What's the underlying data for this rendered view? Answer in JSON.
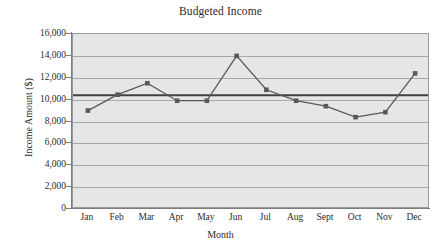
{
  "chart_data": {
    "type": "line",
    "title": "Budgeted Income",
    "xlabel": "Month",
    "ylabel": "Income Amount ($)",
    "categories": [
      "Jan",
      "Feb",
      "Mar",
      "Apr",
      "May",
      "Jun",
      "Jul",
      "Aug",
      "Sept",
      "Oct",
      "Nov",
      "Dec"
    ],
    "values": [
      9000,
      10450,
      11500,
      9900,
      9900,
      14000,
      10900,
      9900,
      9400,
      8400,
      8850,
      12400
    ],
    "series": [
      {
        "name": "Budgeted Income",
        "values": [
          9000,
          10450,
          11500,
          9900,
          9900,
          14000,
          10900,
          9900,
          9400,
          8400,
          8850,
          12400
        ],
        "color": "#595959",
        "marker": "square"
      }
    ],
    "reference_line": {
      "name": "average",
      "value": 10400,
      "color": "#404040"
    },
    "ylim": [
      0,
      16000
    ],
    "ytick_labels": [
      "0",
      "2,000",
      "4,000",
      "6,000",
      "8,000",
      "10,000",
      "12,000",
      "14,000",
      "16,000"
    ],
    "ytick_values": [
      0,
      2000,
      4000,
      6000,
      8000,
      10000,
      12000,
      14000,
      16000
    ],
    "grid": true,
    "grid_color": "#a8a8a8",
    "plot_background": "#e6e6e6",
    "legend": false,
    "legend_position": "none"
  }
}
